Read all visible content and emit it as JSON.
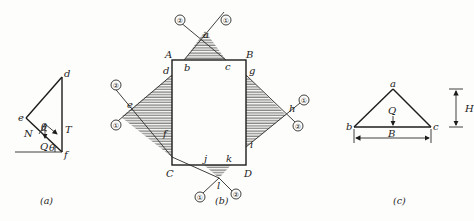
{
  "figure_a": {
    "caption": "(a)",
    "points": {
      "d": "d",
      "e": "e",
      "f": "f"
    },
    "forces": {
      "N": "N",
      "T": "T",
      "Q": "Q"
    },
    "angles": [
      "θ",
      "θ"
    ]
  },
  "figure_b": {
    "caption": "(b)",
    "corners": {
      "A": "A",
      "B": "B",
      "C": "C",
      "D": "D"
    },
    "points": {
      "a": "a",
      "b": "b",
      "c": "c",
      "d": "d",
      "e": "e",
      "f": "f",
      "g": "g",
      "h": "h",
      "i": "i",
      "j": "j",
      "k": "k",
      "l": "l"
    },
    "line_markers": {
      "one": "①",
      "two": "②"
    }
  },
  "figure_c": {
    "caption": "(c)",
    "points": {
      "a": "a",
      "b": "b",
      "c": "c"
    },
    "force": "Q",
    "dimensions": {
      "width": "B",
      "height": "H"
    }
  },
  "colors": {
    "ink": "#1c1c1c",
    "paper": "#fdfdfb"
  }
}
